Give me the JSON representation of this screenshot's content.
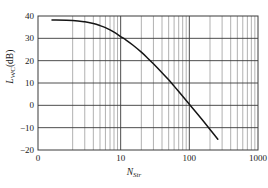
{
  "chart_data": {
    "type": "line",
    "title": "",
    "xlabel": "N_Str",
    "xlabel_main": "N",
    "xlabel_sub": "Str",
    "ylabel": "L_WC (dB)",
    "ylabel_main": "L",
    "ylabel_sub": "WC",
    "ylabel_unit": "(dB)",
    "xscale": "log-with-linear-head",
    "yscale": "linear",
    "xlim": [
      0,
      1000
    ],
    "ylim": [
      -20,
      40
    ],
    "xticks": [
      0,
      10,
      100,
      1000
    ],
    "xtick_labels": [
      "0",
      "10",
      "100",
      "1000"
    ],
    "yticks": [
      -20,
      -10,
      0,
      10,
      20,
      30,
      40
    ],
    "ytick_labels": [
      "-20",
      "-10",
      "0",
      "10",
      "20",
      "30",
      "40"
    ],
    "x_minor_ticks": [
      2,
      3,
      4,
      5,
      6,
      7,
      8,
      9,
      20,
      30,
      40,
      50,
      60,
      70,
      80,
      90,
      200,
      300,
      400,
      500,
      600,
      700,
      800,
      900
    ],
    "grid": true,
    "grid_minor": true,
    "legend": null,
    "series": [
      {
        "name": "L_WC",
        "x": [
          1,
          2,
          3,
          4,
          5,
          6,
          7,
          8,
          9,
          10,
          12,
          15,
          20,
          25,
          30,
          40,
          50,
          60,
          70,
          80,
          90,
          100,
          120,
          150,
          180,
          220,
          260
        ],
        "y": [
          38.2,
          38.0,
          37.4,
          36.6,
          35.7,
          34.8,
          33.8,
          32.8,
          31.8,
          30.8,
          29.2,
          27.0,
          23.8,
          21.0,
          18.6,
          14.6,
          11.4,
          8.6,
          6.2,
          4.1,
          2.2,
          0.5,
          -2.4,
          -6.0,
          -9.0,
          -12.4,
          -15.2
        ]
      }
    ],
    "line_color": "#151515",
    "grid_color": "#8f8f8f",
    "axis_color": "#3a3a3a"
  },
  "ytick_positions": {
    "40": 16,
    "30": 38.33,
    "20": 60.67,
    "10": 83,
    "0": 105.33,
    "-10": 127.67,
    "-20": 150
  },
  "figure": {
    "background": "#ffffff",
    "plot_left": 38,
    "plot_top": 16,
    "plot_right": 258,
    "plot_bottom": 150
  }
}
